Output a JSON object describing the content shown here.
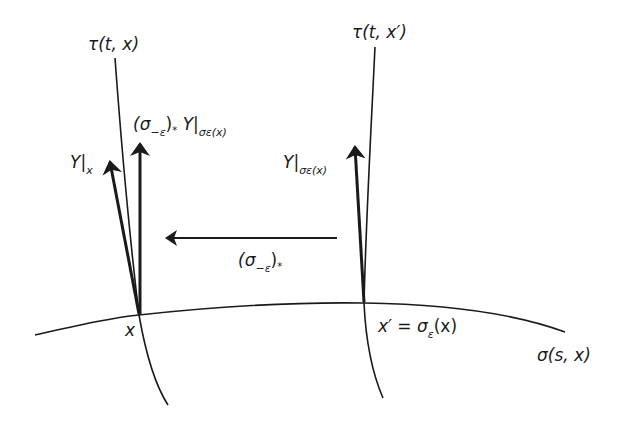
{
  "diagram": {
    "type": "flow-pushforward-vector-field",
    "colors": {
      "stroke": "#1a1a1a",
      "background": "#ffffff"
    },
    "curves": {
      "tau_left": {
        "label": "τ(t, x)"
      },
      "tau_right": {
        "label": "τ(t, x′)"
      },
      "sigma": {
        "label": "σ(s, x)"
      }
    },
    "points": {
      "x": {
        "label": "x"
      },
      "x_prime": {
        "label": "x′ = σε(x)",
        "lhs": "x′",
        "eq": " = ",
        "sigma": "σ",
        "sub": "ε",
        "arg": "(x)"
      }
    },
    "vectors": {
      "Y_at_x": {
        "main": "Y",
        "bar": "|",
        "sub": "x"
      },
      "pushed": {
        "open": "(σ",
        "sub1": "−ε",
        "close": ")",
        "star": "*",
        "Y": " Y",
        "bar": "|",
        "sub2": "σε(x)"
      },
      "Y_at_xprime": {
        "main": "Y",
        "bar": "|",
        "sub": "σε(x)"
      }
    },
    "map_arrow": {
      "open": "(σ",
      "sub": "−ε",
      "close": ")",
      "star": "*"
    }
  }
}
